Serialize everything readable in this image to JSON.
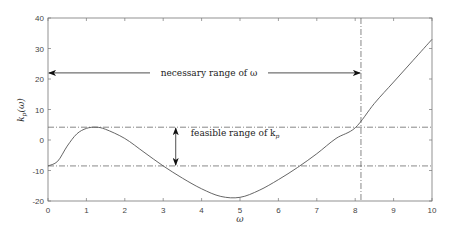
{
  "chart_data": {
    "type": "line",
    "title": "",
    "xlabel": "ω",
    "ylabel": "k_p(ω)",
    "xlim": [
      0,
      10
    ],
    "ylim": [
      -20,
      40
    ],
    "xticks": [
      0,
      1,
      2,
      3,
      4,
      5,
      6,
      7,
      8,
      9,
      10
    ],
    "yticks": [
      -20,
      -10,
      0,
      10,
      20,
      30,
      40
    ],
    "grid": false,
    "series": [
      {
        "name": "k_p(ω)",
        "x": [
          0,
          0.25,
          0.5,
          0.75,
          1.0,
          1.25,
          1.5,
          2.0,
          2.5,
          3.0,
          3.5,
          4.0,
          4.5,
          5.0,
          5.5,
          6.0,
          6.5,
          7.0,
          7.5,
          8.0,
          8.5,
          9.0,
          9.5,
          10.0
        ],
        "y": [
          -8.5,
          -7,
          -2,
          2,
          3.8,
          4.2,
          3.5,
          0.5,
          -4,
          -8.5,
          -12.5,
          -16,
          -18.5,
          -18.8,
          -16.5,
          -13,
          -9,
          -4.5,
          0.5,
          4,
          12,
          19,
          26,
          33
        ]
      }
    ],
    "reference_lines": {
      "horizontal": [
        4.2,
        -8.5
      ],
      "vertical": [
        8.15
      ]
    },
    "annotations": [
      {
        "text": "necessary range of ω",
        "arrow": "horizontal",
        "from_x": 0,
        "to_x": 8.15,
        "y": 22
      },
      {
        "text": "feasible range of k_p",
        "arrow": "vertical",
        "x": 3.3,
        "from_y": 4.2,
        "to_y": -8.5
      }
    ]
  },
  "labels": {
    "xlabel": "ω",
    "ylabel_main": "k",
    "ylabel_sub": "p",
    "ylabel_arg": "(ω)",
    "ann_omega": "necessary range of ω",
    "ann_kp_main": "feasible range of k",
    "ann_kp_sub": "p"
  }
}
